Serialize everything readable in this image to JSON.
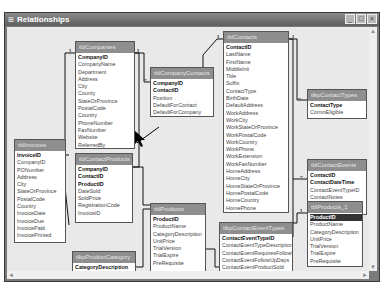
{
  "window": {
    "title": "Relationships",
    "buttons": {
      "minimize": "_",
      "maximize": "□",
      "close": "×"
    }
  },
  "tables": {
    "tblCompanies": {
      "name": "tblCompanies",
      "fields": [
        "CompanyID",
        "CompanyName",
        "Department",
        "Address",
        "City",
        "County",
        "StateOrProvince",
        "PostalCode",
        "Country",
        "PhoneNumber",
        "FaxNumber",
        "Website",
        "ReferredBy"
      ]
    },
    "tblCompanyContacts": {
      "name": "tblCompanyContacts",
      "fields": [
        "CompanyID",
        "ContactID",
        "Position",
        "DefaultForContact",
        "DefaultForCompany"
      ]
    },
    "tblContacts": {
      "name": "tblContacts",
      "fields": [
        "ContactID",
        "LastName",
        "FirstName",
        "MiddleInit",
        "Title",
        "Suffix",
        "ContactType",
        "BirthDate",
        "DefaultAddress",
        "WorkAddress",
        "WorkCity",
        "WorkStateOrProvince",
        "WorkPostalCode",
        "WorkCountry",
        "WorkPhone",
        "WorkExtension",
        "WorkFaxNumber",
        "HomeAddress",
        "HomeCity",
        "HomeStateOrProvince",
        "HomePostalCode",
        "HomeCountry",
        "HomePhone"
      ]
    },
    "tlkpContactTypes": {
      "name": "tlkpContactTypes",
      "fields": [
        "ContactType",
        "CommEligible"
      ]
    },
    "tblInvoices": {
      "name": "tblInvoices",
      "fields": [
        "InvoiceID",
        "CompanyID",
        "PONumber",
        "Address",
        "City",
        "StateOrProvince",
        "PostalCode",
        "Country",
        "InvoiceDate",
        "InvoiceDue",
        "InvoicePaid",
        "InvoicePrinted"
      ]
    },
    "tblContactProducts": {
      "name": "tblContactProducts",
      "fields": [
        "CompanyID",
        "ContactID",
        "ProductID",
        "DateSold",
        "SoldPrice",
        "RegistrationCode",
        "InvoiceID"
      ]
    },
    "tblContactEvents": {
      "name": "tblContactEvents",
      "fields": [
        "ContactID",
        "ContactDateTime",
        "ContactEventTypeID",
        "ContactNotes",
        "ContactFollowUp",
        "ContactFollowUpDate"
      ]
    },
    "tblProducts": {
      "name": "tblProducts",
      "fields": [
        "ProductID",
        "ProductName",
        "CategoryDescription",
        "UnitPrice",
        "TrialVersion",
        "TrialExpire",
        "PreRequisite"
      ]
    },
    "tlkpContactEventTypes": {
      "name": "tlkpContactEventTypes",
      "fields": [
        "ContactEventTypeID",
        "ContactEventTypeDescription",
        "ContactEventRequiresFollowUp",
        "ContactEventFollowUpDays",
        "ContactEventProductSold",
        "ContactEventProductID"
      ]
    },
    "tblProducts_1": {
      "name": "tblProducts_1",
      "fields": [
        "ProductID",
        "ProductName",
        "CategoryDescription",
        "UnitPrice",
        "TrialVersion",
        "TrialExpire",
        "PreRequisite"
      ]
    },
    "tlkpProductCategory": {
      "name": "tlkpProductCategory",
      "fields": [
        "CategoryDescription"
      ]
    }
  },
  "relationship_marks": {
    "one": "1",
    "many": "∞"
  },
  "scroll": {
    "up": "▲",
    "down": "▼",
    "left": "◄",
    "right": "►"
  }
}
